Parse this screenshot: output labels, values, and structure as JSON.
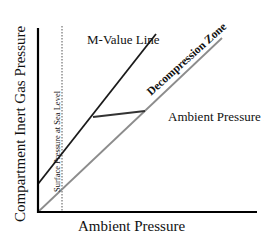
{
  "diagram": {
    "ylabel": "Compartment Inert Gas Pressure",
    "xlabel": "Ambient Pressure",
    "annotations": {
      "m_value_line": "M-Value Line",
      "decompression_zone": "Decompression Zone",
      "ambient_pressure_line": "Ambient Pressure Line",
      "surface_pressure": "Surface Pressure at Sea Level"
    },
    "colors": {
      "m_value_line": "#1a1a1a",
      "ambient_line": "#8c8c8c",
      "axes": "#000000"
    }
  }
}
